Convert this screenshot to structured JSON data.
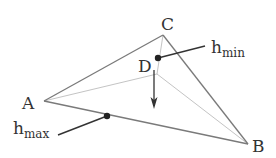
{
  "diagram": {
    "type": "tetrahedron-projection",
    "vertices": [
      {
        "id": "A",
        "label": "A",
        "x": 44,
        "y": 101
      },
      {
        "id": "B",
        "label": "B",
        "x": 248,
        "y": 144
      },
      {
        "id": "C",
        "label": "C",
        "x": 163,
        "y": 35
      },
      {
        "id": "D",
        "label": "D",
        "x": 157,
        "y": 74
      }
    ],
    "annotations": {
      "h_min": {
        "base": "h",
        "sub": "min"
      },
      "h_max": {
        "base": "h",
        "sub": "max"
      }
    },
    "colors": {
      "outer_edge": "#7a7a7a",
      "inner_edge": "#c4c4c4",
      "leader": "#333333",
      "dot": "#222222"
    }
  }
}
